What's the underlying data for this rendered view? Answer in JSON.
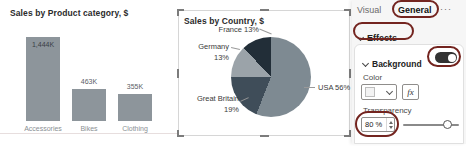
{
  "chart_data": [
    {
      "type": "bar",
      "title": "Sales by Product category, $",
      "categories": [
        "Accessories",
        "Bikes",
        "Clothing"
      ],
      "values": [
        1444,
        463,
        355
      ],
      "value_labels": [
        "1,444K",
        "463K",
        "355K"
      ],
      "unit": "K $",
      "ylim": [
        0,
        1500
      ],
      "bar_color": "#8d959b"
    },
    {
      "type": "pie",
      "title": "Sales by Country, $",
      "slices": [
        {
          "name": "USA",
          "percent": 56,
          "label": "USA 56%",
          "color": "#7e8a92"
        },
        {
          "name": "Great Britain",
          "percent": 19,
          "label": "Great Britain",
          "pct_label": "19%",
          "color": "#3f4d59"
        },
        {
          "name": "Germany",
          "percent": 13,
          "label": "Germany",
          "pct_label": "13%",
          "color": "#9ba3a9"
        },
        {
          "name": "France",
          "percent": 13,
          "label": "France 13%",
          "color": "#222e38"
        }
      ]
    }
  ],
  "panel": {
    "tabs": {
      "visual": "Visual",
      "general": "General",
      "more": "···"
    },
    "effects_label": "Effects",
    "background": {
      "label": "Background",
      "toggle_state": "On",
      "color_label": "Color",
      "fx_label": "fx",
      "transparency_label": "Transparency",
      "transparency_value": "80 %",
      "transparency_percent": 80
    }
  },
  "annotation_color": "#73241f"
}
